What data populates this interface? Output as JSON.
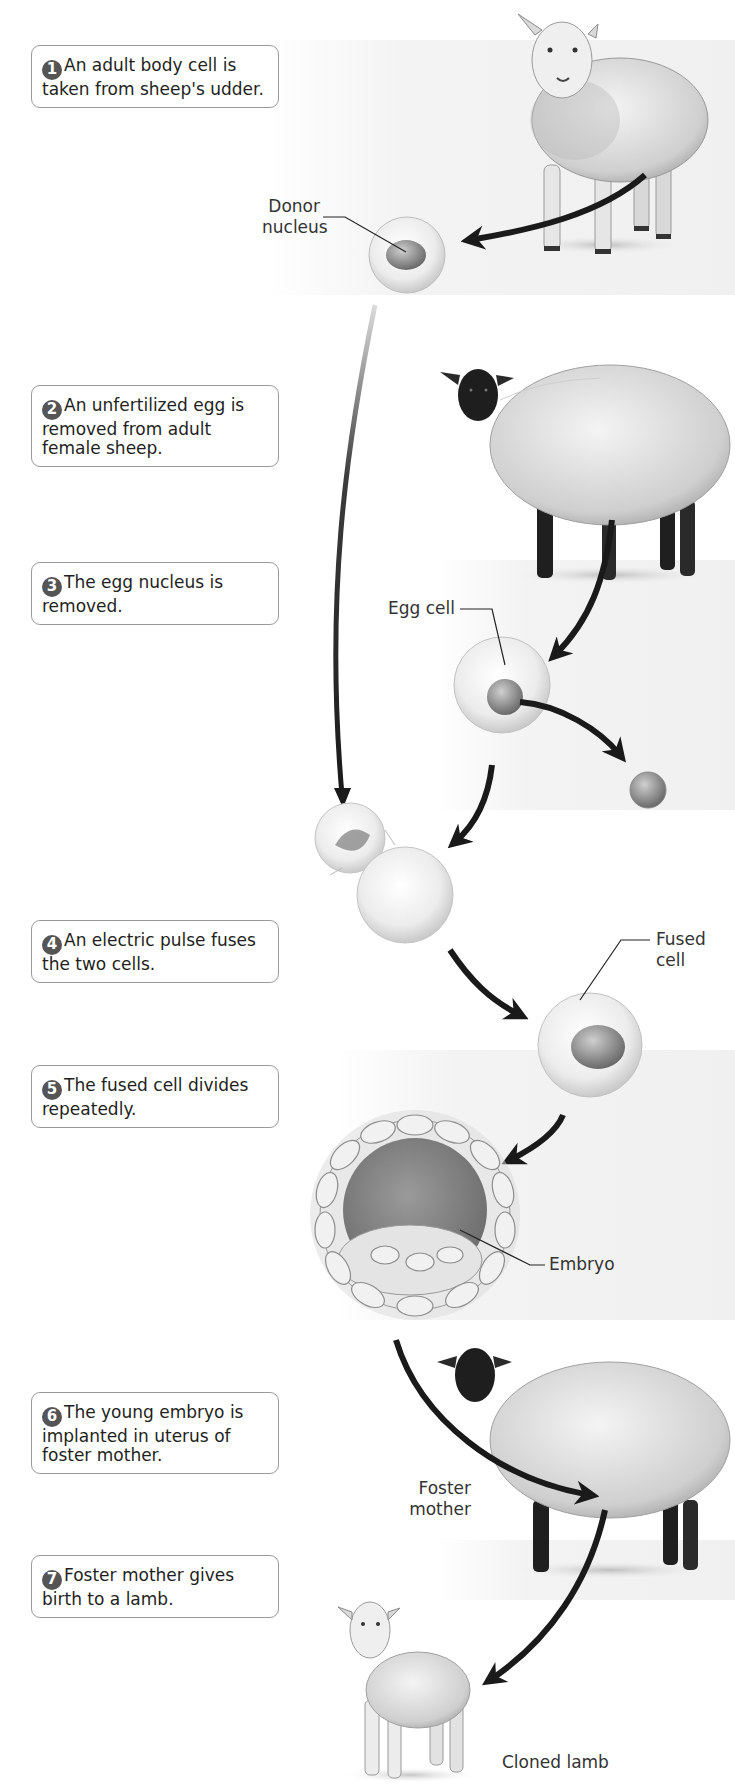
{
  "diagram": {
    "steps": [
      {
        "number": "1",
        "text": "An adult body cell is taken from sheep's udder."
      },
      {
        "number": "2",
        "text": "An unfertilized egg is removed from adult female sheep."
      },
      {
        "number": "3",
        "text": "The egg nucleus is removed."
      },
      {
        "number": "4",
        "text": "An electric pulse fuses the two cells."
      },
      {
        "number": "5",
        "text": "The fused cell divides repeatedly."
      },
      {
        "number": "6",
        "text": "The young embryo is implanted in uterus of foster mother."
      },
      {
        "number": "7",
        "text": "Foster mother gives birth to a lamb."
      }
    ],
    "labels": {
      "donor_nucleus_line1": "Donor",
      "donor_nucleus_line2": "nucleus",
      "egg_cell": "Egg cell",
      "fused_cell": "Fused cell",
      "embryo": "Embryo",
      "foster_mother_line1": "Foster",
      "foster_mother_line2": "mother",
      "cloned_lamb": "Cloned lamb"
    },
    "colors": {
      "arrow": "#1a1a1a",
      "box_border": "#9a9a9a",
      "step_badge": "#555555",
      "text": "#231f20"
    }
  }
}
